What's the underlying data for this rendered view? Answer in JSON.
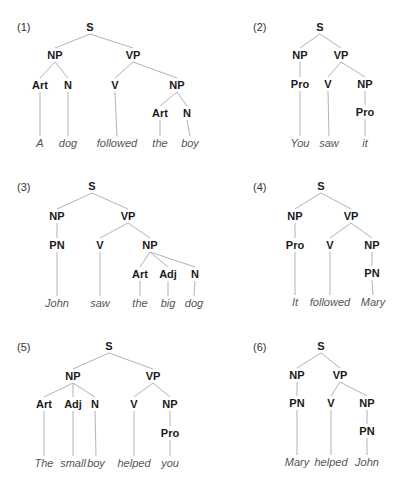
{
  "colors": {
    "edge": "#b3b3b3",
    "category": "#1a1a1a",
    "word": "#555555",
    "number": "#333333"
  },
  "trees": [
    {
      "label": "(1)",
      "label_pos": [
        17,
        27
      ],
      "sentence": "A dog followed the boy",
      "nodes": [
        {
          "id": "S",
          "text": "S",
          "x": 90,
          "y": 27,
          "type": "cat"
        },
        {
          "id": "NP1",
          "text": "NP",
          "x": 55,
          "y": 55,
          "type": "cat",
          "parent": "S"
        },
        {
          "id": "VP",
          "text": "VP",
          "x": 133,
          "y": 55,
          "type": "cat",
          "parent": "S"
        },
        {
          "id": "Art1",
          "text": "Art",
          "x": 40,
          "y": 85,
          "type": "cat",
          "parent": "NP1"
        },
        {
          "id": "N1",
          "text": "N",
          "x": 68,
          "y": 85,
          "type": "cat",
          "parent": "NP1"
        },
        {
          "id": "V",
          "text": "V",
          "x": 115,
          "y": 85,
          "type": "cat",
          "parent": "VP"
        },
        {
          "id": "NP2",
          "text": "NP",
          "x": 177,
          "y": 85,
          "type": "cat",
          "parent": "VP"
        },
        {
          "id": "Art2",
          "text": "Art",
          "x": 160,
          "y": 113,
          "type": "cat",
          "parent": "NP2"
        },
        {
          "id": "N2",
          "text": "N",
          "x": 187,
          "y": 113,
          "type": "cat",
          "parent": "NP2"
        },
        {
          "id": "w1",
          "text": "A",
          "x": 40,
          "y": 143,
          "type": "word",
          "parent": "Art1"
        },
        {
          "id": "w2",
          "text": "dog",
          "x": 68,
          "y": 143,
          "type": "word",
          "parent": "N1"
        },
        {
          "id": "w3",
          "text": "followed",
          "x": 117,
          "y": 143,
          "type": "word",
          "parent": "V"
        },
        {
          "id": "w4",
          "text": "the",
          "x": 160,
          "y": 143,
          "type": "word",
          "parent": "Art2"
        },
        {
          "id": "w5",
          "text": "boy",
          "x": 190,
          "y": 143,
          "type": "word",
          "parent": "N2"
        }
      ]
    },
    {
      "label": "(2)",
      "label_pos": [
        253,
        27
      ],
      "sentence": "You saw it",
      "nodes": [
        {
          "id": "S",
          "text": "S",
          "x": 320,
          "y": 27,
          "type": "cat"
        },
        {
          "id": "NP1",
          "text": "NP",
          "x": 300,
          "y": 55,
          "type": "cat",
          "parent": "S"
        },
        {
          "id": "VP",
          "text": "VP",
          "x": 341,
          "y": 55,
          "type": "cat",
          "parent": "S"
        },
        {
          "id": "Pro1",
          "text": "Pro",
          "x": 300,
          "y": 84,
          "type": "cat",
          "parent": "NP1"
        },
        {
          "id": "V",
          "text": "V",
          "x": 328,
          "y": 84,
          "type": "cat",
          "parent": "VP"
        },
        {
          "id": "NP2",
          "text": "NP",
          "x": 365,
          "y": 84,
          "type": "cat",
          "parent": "VP"
        },
        {
          "id": "Pro2",
          "text": "Pro",
          "x": 365,
          "y": 112,
          "type": "cat",
          "parent": "NP2"
        },
        {
          "id": "w1",
          "text": "You",
          "x": 300,
          "y": 143,
          "type": "word",
          "parent": "Pro1"
        },
        {
          "id": "w2",
          "text": "saw",
          "x": 329,
          "y": 143,
          "type": "word",
          "parent": "V"
        },
        {
          "id": "w3",
          "text": "it",
          "x": 365,
          "y": 143,
          "type": "word",
          "parent": "Pro2"
        }
      ]
    },
    {
      "label": "(3)",
      "label_pos": [
        17,
        187
      ],
      "sentence": "John saw the big dog",
      "nodes": [
        {
          "id": "S",
          "text": "S",
          "x": 92,
          "y": 186,
          "type": "cat"
        },
        {
          "id": "NP1",
          "text": "NP",
          "x": 57,
          "y": 216,
          "type": "cat",
          "parent": "S"
        },
        {
          "id": "VP",
          "text": "VP",
          "x": 128,
          "y": 216,
          "type": "cat",
          "parent": "S"
        },
        {
          "id": "PN",
          "text": "PN",
          "x": 57,
          "y": 245,
          "type": "cat",
          "parent": "NP1"
        },
        {
          "id": "V",
          "text": "V",
          "x": 100,
          "y": 245,
          "type": "cat",
          "parent": "VP"
        },
        {
          "id": "NP2",
          "text": "NP",
          "x": 150,
          "y": 245,
          "type": "cat",
          "parent": "VP"
        },
        {
          "id": "Art",
          "text": "Art",
          "x": 140,
          "y": 274,
          "type": "cat",
          "parent": "NP2"
        },
        {
          "id": "Adj",
          "text": "Adj",
          "x": 168,
          "y": 274,
          "type": "cat",
          "parent": "NP2"
        },
        {
          "id": "N",
          "text": "N",
          "x": 195,
          "y": 274,
          "type": "cat",
          "parent": "NP2"
        },
        {
          "id": "w1",
          "text": "John",
          "x": 57,
          "y": 303,
          "type": "word",
          "parent": "PN"
        },
        {
          "id": "w2",
          "text": "saw",
          "x": 100,
          "y": 303,
          "type": "word",
          "parent": "V"
        },
        {
          "id": "w3",
          "text": "the",
          "x": 140,
          "y": 303,
          "type": "word",
          "parent": "Art"
        },
        {
          "id": "w4",
          "text": "big",
          "x": 168,
          "y": 303,
          "type": "word",
          "parent": "Adj"
        },
        {
          "id": "w5",
          "text": "dog",
          "x": 194,
          "y": 303,
          "type": "word",
          "parent": "N"
        }
      ]
    },
    {
      "label": "(4)",
      "label_pos": [
        253,
        187
      ],
      "sentence": "It followed Mary",
      "nodes": [
        {
          "id": "S",
          "text": "S",
          "x": 321,
          "y": 186,
          "type": "cat"
        },
        {
          "id": "NP1",
          "text": "NP",
          "x": 295,
          "y": 216,
          "type": "cat",
          "parent": "S"
        },
        {
          "id": "VP",
          "text": "VP",
          "x": 351,
          "y": 216,
          "type": "cat",
          "parent": "S"
        },
        {
          "id": "Pro",
          "text": "Pro",
          "x": 295,
          "y": 245,
          "type": "cat",
          "parent": "NP1"
        },
        {
          "id": "V",
          "text": "V",
          "x": 330,
          "y": 245,
          "type": "cat",
          "parent": "VP"
        },
        {
          "id": "NP2",
          "text": "NP",
          "x": 372,
          "y": 245,
          "type": "cat",
          "parent": "VP"
        },
        {
          "id": "PN",
          "text": "PN",
          "x": 372,
          "y": 273,
          "type": "cat",
          "parent": "NP2"
        },
        {
          "id": "w1",
          "text": "It",
          "x": 295,
          "y": 302,
          "type": "word",
          "parent": "Pro"
        },
        {
          "id": "w2",
          "text": "followed",
          "x": 330,
          "y": 302,
          "type": "word",
          "parent": "V"
        },
        {
          "id": "w3",
          "text": "Mary",
          "x": 373,
          "y": 302,
          "type": "word",
          "parent": "PN"
        }
      ]
    },
    {
      "label": "(5)",
      "label_pos": [
        17,
        347
      ],
      "sentence": "The small boy helped you",
      "nodes": [
        {
          "id": "S",
          "text": "S",
          "x": 109,
          "y": 346,
          "type": "cat"
        },
        {
          "id": "NP1",
          "text": "NP",
          "x": 73,
          "y": 376,
          "type": "cat",
          "parent": "S"
        },
        {
          "id": "VP",
          "text": "VP",
          "x": 153,
          "y": 376,
          "type": "cat",
          "parent": "S"
        },
        {
          "id": "Art",
          "text": "Art",
          "x": 44,
          "y": 404,
          "type": "cat",
          "parent": "NP1"
        },
        {
          "id": "Adj",
          "text": "Adj",
          "x": 73,
          "y": 404,
          "type": "cat",
          "parent": "NP1"
        },
        {
          "id": "N",
          "text": "N",
          "x": 95,
          "y": 404,
          "type": "cat",
          "parent": "NP1"
        },
        {
          "id": "V",
          "text": "V",
          "x": 134,
          "y": 404,
          "type": "cat",
          "parent": "VP"
        },
        {
          "id": "NP2",
          "text": "NP",
          "x": 170,
          "y": 404,
          "type": "cat",
          "parent": "VP"
        },
        {
          "id": "Pro",
          "text": "Pro",
          "x": 170,
          "y": 433,
          "type": "cat",
          "parent": "NP2"
        },
        {
          "id": "w1",
          "text": "The",
          "x": 44,
          "y": 463,
          "type": "word",
          "parent": "Art"
        },
        {
          "id": "w2",
          "text": "small",
          "x": 73,
          "y": 463,
          "type": "word",
          "parent": "Adj"
        },
        {
          "id": "w3",
          "text": "boy",
          "x": 96,
          "y": 463,
          "type": "word",
          "parent": "N"
        },
        {
          "id": "w4",
          "text": "helped",
          "x": 134,
          "y": 463,
          "type": "word",
          "parent": "V"
        },
        {
          "id": "w5",
          "text": "you",
          "x": 170,
          "y": 463,
          "type": "word",
          "parent": "Pro"
        }
      ]
    },
    {
      "label": "(6)",
      "label_pos": [
        253,
        347
      ],
      "sentence": "Mary helped John",
      "nodes": [
        {
          "id": "S",
          "text": "S",
          "x": 321,
          "y": 346,
          "type": "cat"
        },
        {
          "id": "NP1",
          "text": "NP",
          "x": 297,
          "y": 375,
          "type": "cat",
          "parent": "S"
        },
        {
          "id": "VP",
          "text": "VP",
          "x": 340,
          "y": 375,
          "type": "cat",
          "parent": "S"
        },
        {
          "id": "PN1",
          "text": "PN",
          "x": 297,
          "y": 403,
          "type": "cat",
          "parent": "NP1"
        },
        {
          "id": "V",
          "text": "V",
          "x": 331,
          "y": 403,
          "type": "cat",
          "parent": "VP"
        },
        {
          "id": "NP2",
          "text": "NP",
          "x": 367,
          "y": 403,
          "type": "cat",
          "parent": "VP"
        },
        {
          "id": "PN2",
          "text": "PN",
          "x": 367,
          "y": 431,
          "type": "cat",
          "parent": "NP2"
        },
        {
          "id": "w1",
          "text": "Mary",
          "x": 297,
          "y": 462,
          "type": "word",
          "parent": "PN1"
        },
        {
          "id": "w2",
          "text": "helped",
          "x": 331,
          "y": 462,
          "type": "word",
          "parent": "V"
        },
        {
          "id": "w3",
          "text": "John",
          "x": 367,
          "y": 462,
          "type": "word",
          "parent": "PN2"
        }
      ]
    }
  ]
}
